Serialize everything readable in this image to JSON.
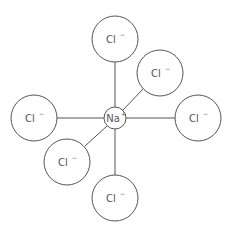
{
  "diagram": {
    "title": "",
    "center": {
      "id": "na",
      "symbol": "Na",
      "charge": "+",
      "x": 115,
      "y": 118,
      "r": 11
    },
    "ligands": [
      {
        "id": "cl-top",
        "symbol": "Cl",
        "charge": "−",
        "x": 115,
        "y": 39,
        "r": 23
      },
      {
        "id": "cl-upper-right",
        "symbol": "Cl",
        "charge": "−",
        "x": 160,
        "y": 73,
        "r": 23
      },
      {
        "id": "cl-left",
        "symbol": "Cl",
        "charge": "−",
        "x": 34,
        "y": 118,
        "r": 23
      },
      {
        "id": "cl-right",
        "symbol": "Cl",
        "charge": "−",
        "x": 198,
        "y": 118,
        "r": 23
      },
      {
        "id": "cl-lower-left",
        "symbol": "Cl",
        "charge": "−",
        "x": 67,
        "y": 162,
        "r": 23
      },
      {
        "id": "cl-bottom",
        "symbol": "Cl",
        "charge": "−",
        "x": 115,
        "y": 198,
        "r": 23
      }
    ],
    "colors": {
      "stroke": "#555555",
      "fill": "#ffffff",
      "text": "#555555"
    }
  }
}
